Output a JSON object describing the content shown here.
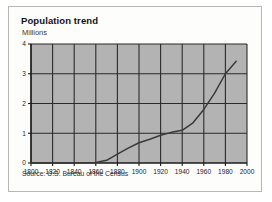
{
  "figure": {
    "title": "Population trend",
    "subtitle": "Millions",
    "source": "Source: U.S. Bureau of the Census"
  },
  "colors": {
    "plot_fill": "#b3b3b3",
    "grid": "#2b2b2b",
    "axis": "#1b1b1b",
    "series": "#3a3a3a",
    "card_bg": "#fdfdfc",
    "card_border": "#b9b7b2",
    "page_bg": "#ffffff",
    "text": "#111111"
  },
  "chart_data": {
    "type": "line",
    "title": "Population trend",
    "subtitle": "Millions",
    "xlabel": "",
    "ylabel": "Millions",
    "xlim": [
      1800,
      2000
    ],
    "ylim": [
      0,
      4
    ],
    "grid": true,
    "legend": "none",
    "xticks": [
      1800,
      1820,
      1840,
      1860,
      1880,
      1900,
      1920,
      1940,
      1960,
      1980,
      2000
    ],
    "yticks": [
      0,
      1,
      2,
      3,
      4
    ],
    "xtick_labels": [
      "1800",
      "1820",
      "1840",
      "1860",
      "1880",
      "1900",
      "1920",
      "1940",
      "1960",
      "1980",
      "2000"
    ],
    "ytick_labels": [
      "0",
      "1",
      "2",
      "3",
      "4"
    ],
    "series": [
      {
        "name": "Population",
        "x": [
          1800,
          1820,
          1840,
          1860,
          1870,
          1880,
          1890,
          1900,
          1910,
          1920,
          1930,
          1940,
          1950,
          1960,
          1970,
          1980,
          1990
        ],
        "values": [
          0.0,
          0.0,
          0.0,
          0.02,
          0.09,
          0.3,
          0.5,
          0.68,
          0.8,
          0.93,
          1.03,
          1.1,
          1.35,
          1.8,
          2.35,
          3.0,
          3.42
        ]
      }
    ]
  }
}
